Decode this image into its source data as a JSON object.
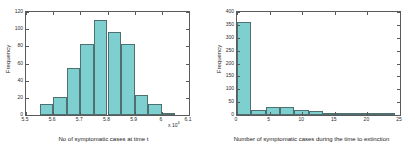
{
  "figure": {
    "background": "#ffffff",
    "bar_fill": "#7ed0d0",
    "bar_edge": "#4f6f70",
    "axis_color": "#5a5a5a"
  },
  "chart_data": [
    {
      "type": "bar",
      "title": "",
      "xlabel": "No of symptomatic cases at time t",
      "ylabel": "Frequency",
      "x_exponent_label": "x 10",
      "x_exponent_power": "4",
      "xlim": [
        5.5,
        6.1
      ],
      "ylim": [
        0,
        120
      ],
      "grid": false,
      "legend": null,
      "xticks": [
        "5.5",
        "5.6",
        "5.7",
        "5.8",
        "5.9",
        "6",
        "6.1"
      ],
      "xtick_values": [
        5.5,
        5.6,
        5.7,
        5.8,
        5.9,
        6.0,
        6.1
      ],
      "yticks": [
        "0",
        "20",
        "40",
        "60",
        "80",
        "100",
        "120"
      ],
      "ytick_values": [
        0,
        20,
        40,
        60,
        80,
        100,
        120
      ],
      "bins": [
        {
          "left": 5.55,
          "right": 5.6,
          "value": 13
        },
        {
          "left": 5.6,
          "right": 5.65,
          "value": 21
        },
        {
          "left": 5.65,
          "right": 5.7,
          "value": 55
        },
        {
          "left": 5.7,
          "right": 5.75,
          "value": 83
        },
        {
          "left": 5.75,
          "right": 5.8,
          "value": 111
        },
        {
          "left": 5.8,
          "right": 5.85,
          "value": 97
        },
        {
          "left": 5.85,
          "right": 5.9,
          "value": 83
        },
        {
          "left": 5.9,
          "right": 5.95,
          "value": 23
        },
        {
          "left": 5.95,
          "right": 6.0,
          "value": 13
        },
        {
          "left": 6.0,
          "right": 6.05,
          "value": 1
        }
      ]
    },
    {
      "type": "bar",
      "title": "",
      "xlabel": "Number of symptomatic cases during the time to extinction",
      "ylabel": "Frequency",
      "xlim": [
        0,
        25
      ],
      "ylim": [
        0,
        400
      ],
      "grid": false,
      "legend": null,
      "xticks": [
        "0",
        "5",
        "10",
        "15",
        "20",
        "25"
      ],
      "xtick_values": [
        0,
        5,
        10,
        15,
        20,
        25
      ],
      "yticks": [
        "0",
        "50",
        "100",
        "150",
        "200",
        "250",
        "300",
        "350",
        "400"
      ],
      "ytick_values": [
        0,
        50,
        100,
        150,
        200,
        250,
        300,
        350,
        400
      ],
      "bins": [
        {
          "left": 0,
          "right": 2.2,
          "value": 363
        },
        {
          "left": 2.2,
          "right": 4.4,
          "value": 20
        },
        {
          "left": 4.4,
          "right": 6.6,
          "value": 30
        },
        {
          "left": 6.6,
          "right": 8.8,
          "value": 31
        },
        {
          "left": 8.8,
          "right": 11.0,
          "value": 21
        },
        {
          "left": 11.0,
          "right": 13.2,
          "value": 14
        },
        {
          "left": 13.2,
          "right": 15.4,
          "value": 8
        },
        {
          "left": 15.4,
          "right": 17.6,
          "value": 5
        },
        {
          "left": 17.6,
          "right": 19.8,
          "value": 2
        },
        {
          "left": 19.8,
          "right": 22.0,
          "value": 3
        },
        {
          "left": 22.0,
          "right": 24.2,
          "value": 1
        }
      ]
    }
  ]
}
